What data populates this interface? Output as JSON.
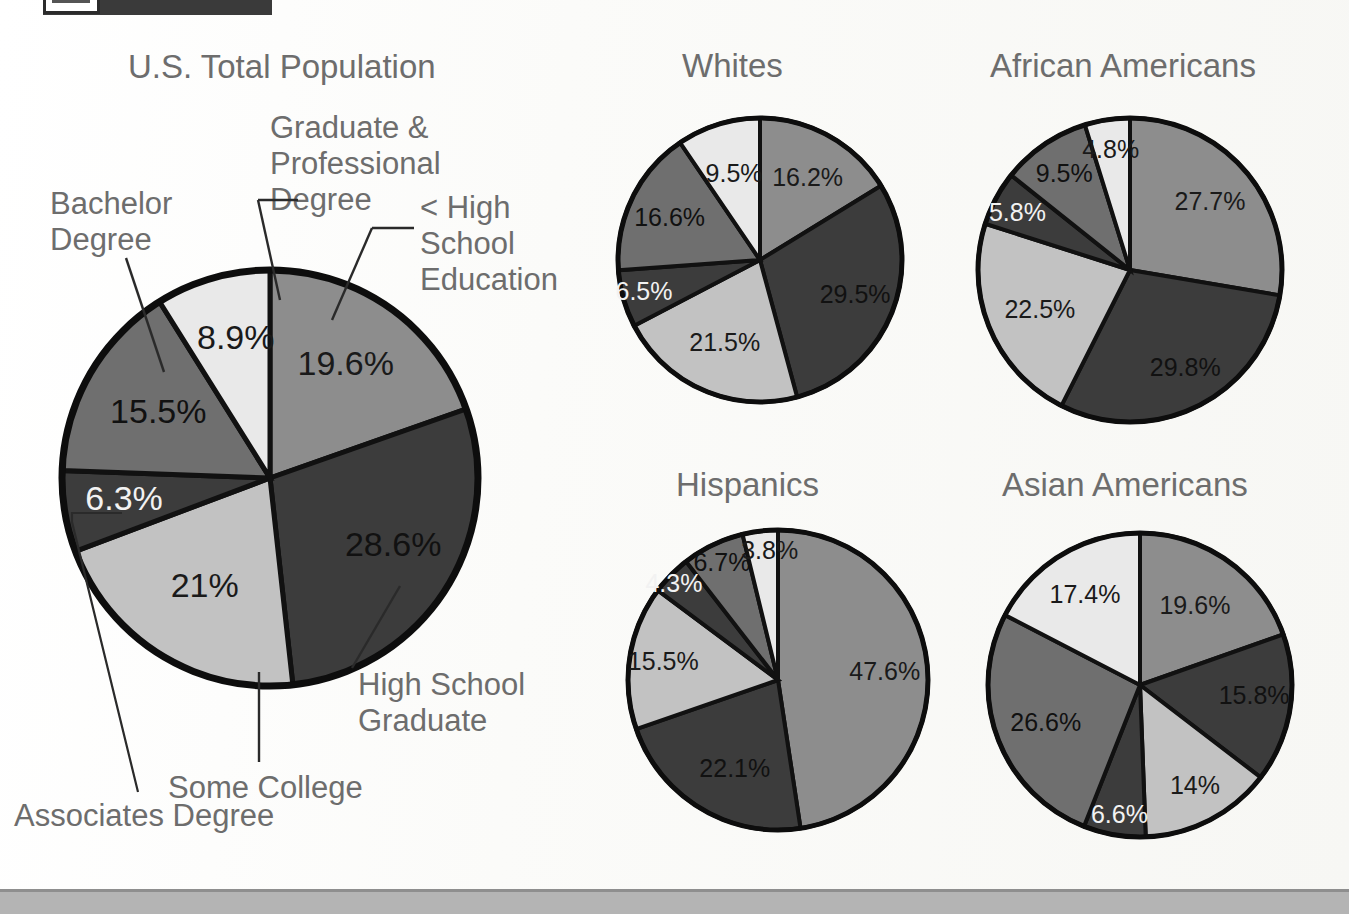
{
  "document": {
    "header_bar_color": "#3a3a3a",
    "footer_strip_color": "#b4b4b4",
    "background_color": "#fdfdfb",
    "label_color": "#6d6d6d"
  },
  "categories": [
    "< High School Education",
    "High School Graduate",
    "Some College",
    "Associates Degree",
    "Bachelor Degree",
    "Graduate & Professional Degree"
  ],
  "slice_colors": [
    "#8d8d8d",
    "#3c3c3c",
    "#c2c2c2",
    "#3c3c3c",
    "#6f6f6f",
    "#e9e9e9"
  ],
  "slice_label_colors": [
    "#1a1a1a",
    "#111111",
    "#1a1a1a",
    "#f2f2f2",
    "#111111",
    "#1a1a1a"
  ],
  "callouts": {
    "graduate_professional": "Graduate &\nProfessional\nDegree",
    "bachelor": "Bachelor\nDegree",
    "less_than_high_school": "< High\nSchool\nEducation",
    "high_school_graduate": "High School\nGraduate",
    "some_college": "Some College",
    "associates": "Associates Degree"
  },
  "chart_data": [
    {
      "type": "pie",
      "title": "U.S. Total Population",
      "categories": [
        "< High School Education",
        "High School Graduate",
        "Some College",
        "Associates Degree",
        "Bachelor Degree",
        "Graduate & Professional Degree"
      ],
      "values": [
        19.6,
        28.6,
        21,
        6.3,
        15.5,
        8.9
      ],
      "labels": [
        "19.6%",
        "28.6%",
        "21%",
        "6.3%",
        "15.5%",
        "8.9%"
      ],
      "start_angle_deg": 0,
      "direction": "clockwise"
    },
    {
      "type": "pie",
      "title": "Whites",
      "categories": [
        "< High School Education",
        "High School Graduate",
        "Some College",
        "Associates Degree",
        "Bachelor Degree",
        "Graduate & Professional Degree"
      ],
      "values": [
        16.2,
        29.5,
        21.5,
        6.5,
        16.6,
        9.5
      ],
      "labels": [
        "16.2%",
        "29.5%",
        "21.5%",
        "6.5%",
        "16.6%",
        "9.5%"
      ],
      "start_angle_deg": 0,
      "direction": "clockwise"
    },
    {
      "type": "pie",
      "title": "African Americans",
      "categories": [
        "< High School Education",
        "High School Graduate",
        "Some College",
        "Associates Degree",
        "Bachelor Degree",
        "Graduate & Professional Degree"
      ],
      "values": [
        27.7,
        29.8,
        22.5,
        5.8,
        9.5,
        4.8
      ],
      "labels": [
        "27.7%",
        "29.8%",
        "22.5%",
        "5.8%",
        "9.5%",
        "4.8%"
      ],
      "start_angle_deg": 0,
      "direction": "clockwise"
    },
    {
      "type": "pie",
      "title": "Hispanics",
      "categories": [
        "< High School Education",
        "High School Graduate",
        "Some College",
        "Associates Degree",
        "Bachelor Degree",
        "Graduate & Professional Degree"
      ],
      "values": [
        47.6,
        22.1,
        15.5,
        4.3,
        6.7,
        3.8
      ],
      "labels": [
        "47.6%",
        "22.1%",
        "15.5%",
        "4.3%",
        "6.7%",
        "3.8%"
      ],
      "start_angle_deg": 0,
      "direction": "clockwise"
    },
    {
      "type": "pie",
      "title": "Asian Americans",
      "categories": [
        "< High School Education",
        "High School Graduate",
        "Some College",
        "Associates Degree",
        "Bachelor Degree",
        "Graduate & Professional Degree"
      ],
      "values": [
        19.6,
        15.8,
        14,
        6.6,
        26.6,
        17.4
      ],
      "labels": [
        "19.6%",
        "15.8%",
        "14%",
        "6.6%",
        "26.6%",
        "17.4%"
      ],
      "start_angle_deg": 0,
      "direction": "clockwise"
    }
  ]
}
